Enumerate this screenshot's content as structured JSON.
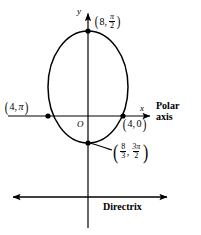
{
  "figure": {
    "type": "polar-conic-graph",
    "background_color": "#ffffff",
    "stroke_color": "#000000",
    "axes": {
      "y_axis_label": "y",
      "x_axis_label": "x",
      "origin_label": "O",
      "polar_axis_label_line1": "Polar",
      "polar_axis_label_line2": "axis",
      "directrix_label": "Directrix"
    },
    "points": [
      {
        "name": "top-vertex",
        "r": "8",
        "theta_num": "π",
        "theta_den": "2",
        "theta_display": "π/2",
        "label": "(8, π/2)",
        "x": 88,
        "y": 31
      },
      {
        "name": "left-point",
        "r": "4",
        "theta_display": "π",
        "label": "(4, π)",
        "x": 48,
        "y": 116
      },
      {
        "name": "right-point",
        "r": "4",
        "theta_display": "0",
        "label": "(4, 0)",
        "x": 123,
        "y": 116
      },
      {
        "name": "bottom-vertex",
        "r_num": "8",
        "r_den": "3",
        "theta_num": "3π",
        "theta_den": "2",
        "label": "(8/3, 3π/2)",
        "x": 88,
        "y": 143
      }
    ],
    "curve": {
      "shape": "ellipse",
      "center_x": 88,
      "center_y": 87,
      "radius_x": 40,
      "radius_y": 56
    },
    "labels": {
      "top_point": {
        "r": "8",
        "theta_num": "π",
        "theta_den": "2"
      },
      "left_point": {
        "r": "4",
        "theta": "π"
      },
      "right_point": {
        "r": "4",
        "theta": "0"
      },
      "bottom_point": {
        "r_num": "8",
        "r_den": "3",
        "theta_num": "3π",
        "theta_den": "2"
      }
    }
  }
}
